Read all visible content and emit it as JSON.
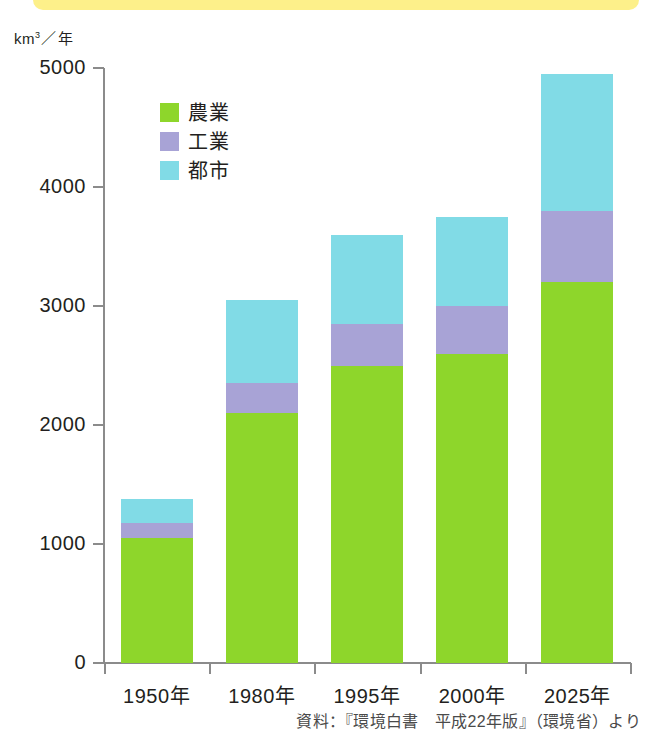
{
  "banner": {
    "color": "#fdf08a"
  },
  "axis": {
    "unit_prefix": "km",
    "unit_sup": "3",
    "unit_slash": "／",
    "unit_suffix": "年"
  },
  "legend": {
    "items": [
      {
        "label": "農業",
        "color": "#8ed62b",
        "key": "nogyo"
      },
      {
        "label": "工業",
        "color": "#a8a3d6",
        "key": "kogyo"
      },
      {
        "label": "都市",
        "color": "#81dbe6",
        "key": "toshi"
      }
    ]
  },
  "source": {
    "text": "資料：『環境白書　平成22年版』（環境省）より"
  },
  "chart_data": {
    "type": "bar",
    "stacked": true,
    "title": "",
    "xlabel": "",
    "ylabel": "km3／年",
    "ylim": [
      0,
      5000
    ],
    "yticks": [
      0,
      1000,
      2000,
      3000,
      4000,
      5000
    ],
    "ytick_labels": [
      "0",
      "1000",
      "2000",
      "3000",
      "4000",
      "5000"
    ],
    "grid": false,
    "legend_position": "inside-top-left",
    "categories": [
      "1950年",
      "1980年",
      "1995年",
      "2000年",
      "2025年"
    ],
    "series": [
      {
        "name": "農業",
        "color": "#8ed62b",
        "values": [
          1050,
          2100,
          2500,
          2600,
          3200
        ]
      },
      {
        "name": "工業",
        "color": "#a8a3d6",
        "values": [
          130,
          250,
          350,
          400,
          600
        ]
      },
      {
        "name": "都市",
        "color": "#81dbe6",
        "values": [
          200,
          700,
          750,
          750,
          1150
        ]
      }
    ],
    "totals": [
      1380,
      3050,
      3600,
      3750,
      4950
    ]
  }
}
